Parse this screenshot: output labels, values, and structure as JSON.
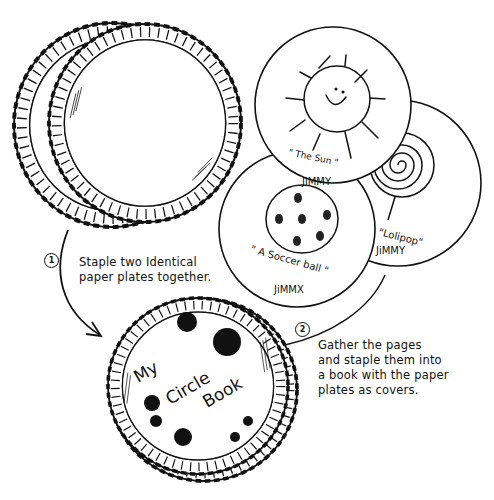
{
  "diagram": {
    "steps": [
      {
        "number": "1",
        "text_line1": "Staple two Identical",
        "text_line2": "paper plates together."
      },
      {
        "number": "2",
        "text_line1": "Gather the pages",
        "text_line2": "and staple them into",
        "text_line3": "a book with the paper",
        "text_line4": "plates as covers."
      }
    ],
    "pages": [
      {
        "id": "sun",
        "caption": "\" The Sun \"",
        "author": "JiMMY"
      },
      {
        "id": "soccer",
        "caption": "\" A Soccer ball \"",
        "author": "JiMMX"
      },
      {
        "id": "lolipop",
        "caption": "\"Lolipop\"",
        "author": "JiMMY"
      }
    ],
    "cover": {
      "word1": "My",
      "word2": "Circle",
      "word3": "Book"
    },
    "colors": {
      "ink": "#111111",
      "paper": "#ffffff"
    }
  }
}
